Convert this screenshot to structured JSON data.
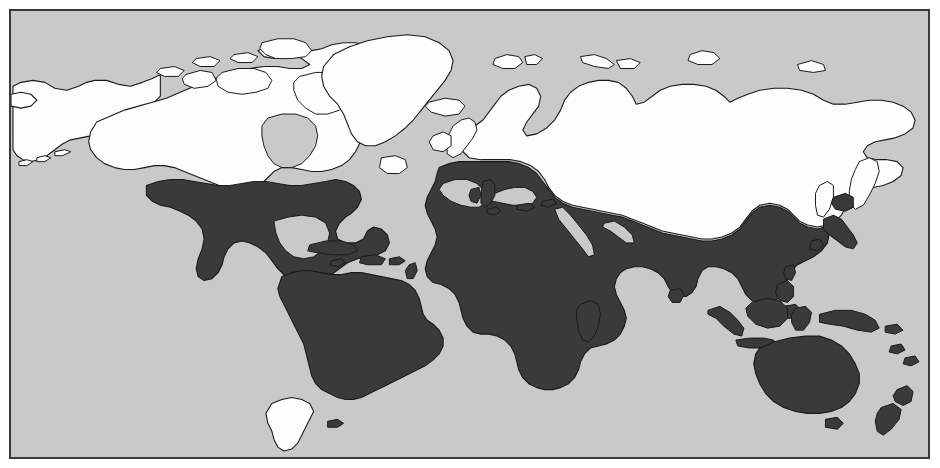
{
  "figure": {
    "type": "thematic-world-map",
    "projection": "equirectangular",
    "background_color": "#ffffff",
    "ocean_color": "#c9c9c9",
    "frame_color": "#3a3a3a",
    "coastline_color": "#1a1a1a"
  },
  "classes": [
    {
      "id": "north",
      "label": "",
      "fill": "#fdfdfd",
      "regions": [
        "Alaska",
        "Canada",
        "Greenland",
        "Iceland",
        "Northern United States",
        "United Kingdom",
        "Ireland",
        "Scandinavia",
        "Norway",
        "Sweden",
        "Finland",
        "Baltic States",
        "Belarus",
        "Poland (north)",
        "Germany (north)",
        "Russia",
        "Siberia",
        "Kazakhstan",
        "Mongolia",
        "Northern China",
        "Sakhalin",
        "Kuril Islands",
        "Svalbard",
        "Novaya Zemlya",
        "Patagonia",
        "Southern Chile",
        "Southern Argentina",
        "Tierra del Fuego"
      ]
    },
    {
      "id": "south",
      "label": "",
      "fill": "#3a3a3a",
      "regions": [
        "Southern United States",
        "Mexico",
        "Central America",
        "Cuba",
        "Hispaniola",
        "Caribbean Islands",
        "Colombia",
        "Venezuela",
        "Brazil",
        "Peru",
        "Bolivia",
        "Paraguay",
        "Uruguay",
        "Northern Argentina",
        "Chile (north)",
        "Portugal",
        "Spain",
        "France (south)",
        "Italy",
        "Greece",
        "Turkey",
        "Balkans",
        "Morocco",
        "Algeria",
        "Tunisia",
        "Libya",
        "Egypt",
        "Sahara",
        "West Africa",
        "Central Africa",
        "East Africa",
        "Southern Africa",
        "Madagascar",
        "Arabian Peninsula",
        "Iran",
        "Iraq",
        "Afghanistan",
        "Pakistan",
        "India",
        "Sri Lanka",
        "Nepal",
        "Bangladesh",
        "Myanmar",
        "Thailand",
        "Vietnam",
        "Malaysia",
        "Southern China",
        "Taiwan",
        "Japan",
        "Korea",
        "Philippines",
        "Indonesia",
        "Borneo",
        "New Guinea",
        "Australia",
        "Tasmania",
        "New Zealand",
        "Fiji"
      ]
    }
  ],
  "labels": {
    "title": "",
    "caption": "",
    "legend_entries": []
  }
}
